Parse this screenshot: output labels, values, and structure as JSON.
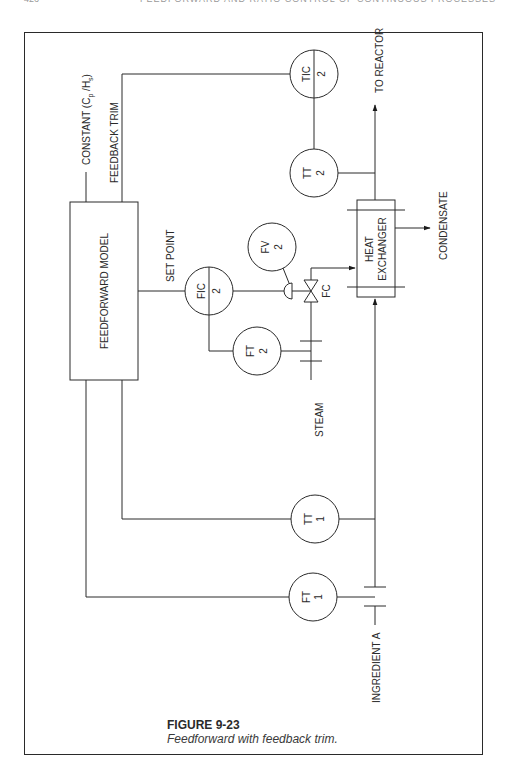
{
  "page": {
    "header_left": "426",
    "header_right": "FEEDFORWARD AND RATIO CONTROL OF CONTINUOUS PROCESSES"
  },
  "diagram": {
    "blocks": {
      "feedforward_model": "FEEDFORWARD MODEL",
      "heat_exchanger_line1": "HEAT",
      "heat_exchanger_line2": "EXCHANGER"
    },
    "instruments": {
      "tic2": {
        "tag": "TIC",
        "loop": "2"
      },
      "tt2": {
        "tag": "TT",
        "loop": "2"
      },
      "fic2": {
        "tag": "FIC",
        "loop": "2"
      },
      "fv2": {
        "tag": "FV",
        "loop": "2"
      },
      "ft2": {
        "tag": "FT",
        "loop": "2"
      },
      "tt1": {
        "tag": "TT",
        "loop": "1"
      },
      "ft1": {
        "tag": "FT",
        "loop": "1"
      }
    },
    "labels": {
      "constant": "CONSTANT (C",
      "constant_sub_p": "p",
      "constant_mid": " /H",
      "constant_sub_s": "s",
      "constant_end": ")",
      "feedback_trim": "FEEDBACK TRIM",
      "set_point": "SET POINT",
      "fail_closed": "FC",
      "to_reactor": "TO REACTOR",
      "condensate": "CONDENSATE",
      "steam": "STEAM",
      "ingredient_a": "INGREDIENT A"
    }
  },
  "caption": {
    "title": "FIGURE 9-23",
    "subtitle": "Feedforward with feedback trim."
  }
}
